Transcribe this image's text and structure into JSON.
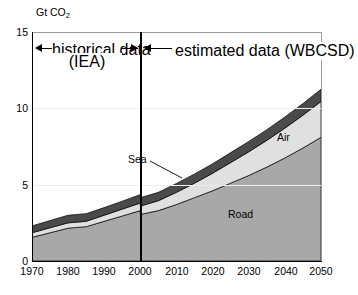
{
  "chart_data": {
    "type": "area",
    "stacked": true,
    "title": "",
    "subtitle": "",
    "xlabel": "",
    "ylabel": "Gt CO2",
    "ylabel_display": "Gt CO",
    "ylabel_sub": "2",
    "xlim": [
      1970,
      2050
    ],
    "ylim": [
      0,
      15
    ],
    "yticks": [
      0,
      5,
      10,
      15
    ],
    "xticks": [
      1970,
      1980,
      1990,
      2000,
      2010,
      2020,
      2030,
      2040,
      2050
    ],
    "grid": "horizontal-faint",
    "legend": "inline-labels",
    "x": [
      1970,
      1975,
      1980,
      1985,
      1990,
      1995,
      2000,
      2000,
      2005,
      2010,
      2015,
      2020,
      2025,
      2030,
      2035,
      2040,
      2045,
      2050
    ],
    "series": [
      {
        "name": "Road",
        "color": "#a8a8a8",
        "values": [
          1.55,
          1.85,
          2.15,
          2.25,
          2.6,
          2.95,
          3.3,
          3.05,
          3.3,
          3.7,
          4.15,
          4.6,
          5.1,
          5.6,
          6.15,
          6.75,
          7.4,
          8.1
        ]
      },
      {
        "name": "Air",
        "color": "#e0e0e0",
        "values": [
          0.3,
          0.33,
          0.35,
          0.35,
          0.4,
          0.45,
          0.5,
          0.55,
          0.65,
          0.8,
          0.95,
          1.15,
          1.35,
          1.55,
          1.75,
          1.95,
          2.15,
          2.35
        ]
      },
      {
        "name": "Sea",
        "color": "#4a4a4a",
        "values": [
          0.45,
          0.47,
          0.5,
          0.5,
          0.5,
          0.52,
          0.55,
          0.55,
          0.55,
          0.58,
          0.6,
          0.62,
          0.65,
          0.68,
          0.7,
          0.73,
          0.76,
          0.8
        ]
      }
    ],
    "totals_note": "Road + Air + Sea stacked to total CO2 from transport",
    "annotations": [
      {
        "name": "historical-band",
        "line1": "historical data",
        "line2": "(IEA)",
        "from": 1970,
        "to": 2000
      },
      {
        "name": "estimated-band",
        "line1": "estimated data (WBCSD)",
        "line2": "",
        "from": 2000,
        "to": 2050
      }
    ],
    "series_labels": [
      {
        "name": "Sea",
        "text": "Sea"
      },
      {
        "name": "Air",
        "text": "Air"
      },
      {
        "name": "Road",
        "text": "Road"
      }
    ],
    "divider_year": 2000
  },
  "axis": {
    "y": {
      "t0": "0",
      "t1": "5",
      "t2": "10",
      "t3": "15"
    },
    "x": {
      "t0": "1970",
      "t1": "1980",
      "t2": "1990",
      "t3": "2000",
      "t4": "2010",
      "t5": "2020",
      "t6": "2030",
      "t7": "2040",
      "t8": "2050"
    }
  },
  "labels": {
    "unit_main": "Gt CO",
    "unit_sub": "2",
    "historical_l1": "historical data",
    "historical_l2": "(IEA)",
    "estimated_l1": "estimated data (WBCSD)",
    "sea": "Sea",
    "air": "Air",
    "road": "Road"
  }
}
